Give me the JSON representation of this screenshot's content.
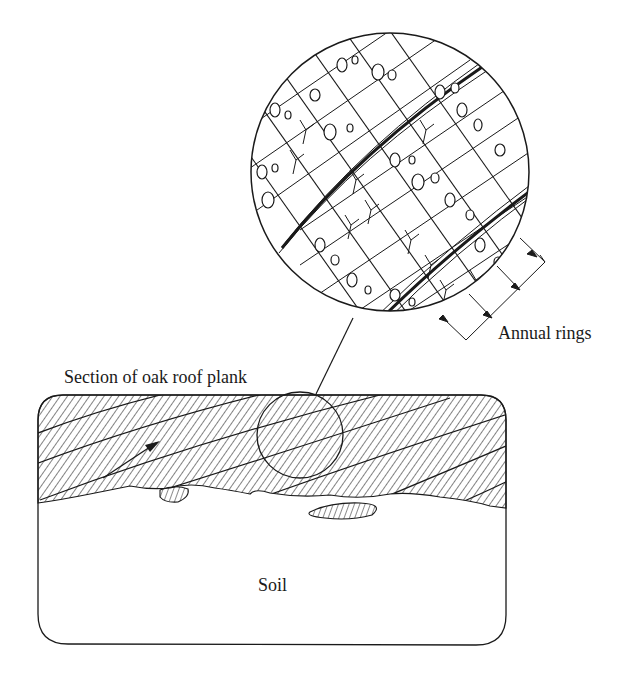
{
  "figure": {
    "labels": {
      "annual_rings": "Annual rings",
      "plank_section": "Section of oak roof plank",
      "soil": "Soil"
    },
    "colors": {
      "ink": "#1a1a1a",
      "background": "#ffffff"
    },
    "elements": {
      "magnified_view": "circular magnified cross-section of oak wood showing vessels, rays and annual ring boundaries",
      "plank": "rounded rectangle containing hatched oak plank resting on soil",
      "grain_arrow": "arrow indicating grain direction",
      "leader_line": "line linking small circle on plank to magnified view"
    }
  }
}
